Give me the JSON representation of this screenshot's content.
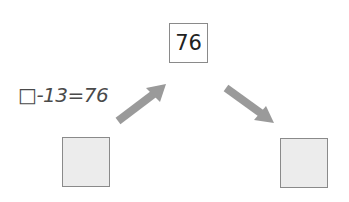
{
  "diagram": {
    "top_value": "76",
    "equation": "□-13=76",
    "left_box_value": "",
    "right_box_value": "",
    "colors": {
      "arrow": "#9a9a9a",
      "box_border": "#8a8a8a",
      "box_fill": "#ececec",
      "text": "#222222"
    },
    "arrows": [
      {
        "name": "up-right",
        "from": "left-box",
        "to": "top-box"
      },
      {
        "name": "down-right",
        "from": "top-box",
        "to": "right-box"
      }
    ]
  }
}
